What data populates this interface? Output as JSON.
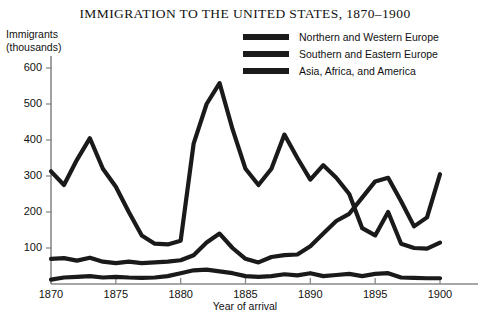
{
  "chart_data": {
    "type": "line",
    "title": "IMMIGRATION TO THE UNITED STATES, 1870–1900",
    "xlabel": "Year of arrival",
    "ylabel": "Immigrants (thousands)",
    "ylabel_line1": "Immigrants",
    "ylabel_line2": "(thousands)",
    "xlim": [
      1870,
      1900
    ],
    "ylim": [
      0,
      640
    ],
    "grid": false,
    "legend_position": "top-right",
    "y_ticks": [
      100,
      200,
      300,
      400,
      500,
      600
    ],
    "y_tick_labels": [
      "100",
      "200",
      "300",
      "400",
      "500",
      "600"
    ],
    "x_ticks": [
      1870,
      1875,
      1880,
      1885,
      1890,
      1895,
      1900
    ],
    "x_tick_labels": [
      "1870",
      "1875",
      "1880",
      "1885",
      "1890",
      "1895",
      "1900"
    ],
    "x": [
      1870,
      1871,
      1872,
      1873,
      1874,
      1875,
      1876,
      1877,
      1878,
      1879,
      1880,
      1881,
      1882,
      1883,
      1884,
      1885,
      1886,
      1887,
      1888,
      1889,
      1890,
      1891,
      1892,
      1893,
      1894,
      1895,
      1896,
      1897,
      1898,
      1899,
      1900
    ],
    "series": [
      {
        "name": "Northern and Western Europe",
        "color": "#1a1a1a",
        "values": [
          313,
          275,
          345,
          405,
          320,
          270,
          200,
          135,
          112,
          110,
          120,
          390,
          500,
          558,
          430,
          320,
          275,
          320,
          415,
          350,
          290,
          330,
          295,
          250,
          155,
          135,
          200,
          112,
          100,
          98,
          115
        ]
      },
      {
        "name": "Southern and Eastern Europe",
        "color": "#1a1a1a",
        "values": [
          70,
          72,
          65,
          73,
          62,
          58,
          62,
          58,
          60,
          62,
          66,
          80,
          115,
          140,
          100,
          70,
          60,
          75,
          80,
          82,
          105,
          140,
          175,
          195,
          240,
          285,
          295,
          230,
          160,
          185,
          305
        ]
      },
      {
        "name": "Asia, Africa, and America",
        "color": "#1a1a1a",
        "values": [
          12,
          18,
          20,
          22,
          18,
          20,
          18,
          17,
          18,
          22,
          30,
          38,
          40,
          35,
          30,
          22,
          20,
          22,
          27,
          24,
          30,
          22,
          25,
          28,
          22,
          28,
          30,
          18,
          17,
          16,
          16
        ]
      }
    ]
  },
  "chart": {
    "title": "IMMIGRATION TO THE UNITED STATES, 1870–1900",
    "y_axis_label_line1": "Immigrants",
    "y_axis_label_line2": "(thousands)",
    "x_axis_label": "Year of arrival"
  },
  "legend": {
    "items": [
      {
        "label": "Northern and Western Europe"
      },
      {
        "label": "Southern and Eastern Europe"
      },
      {
        "label": "Asia, Africa, and America"
      }
    ]
  }
}
